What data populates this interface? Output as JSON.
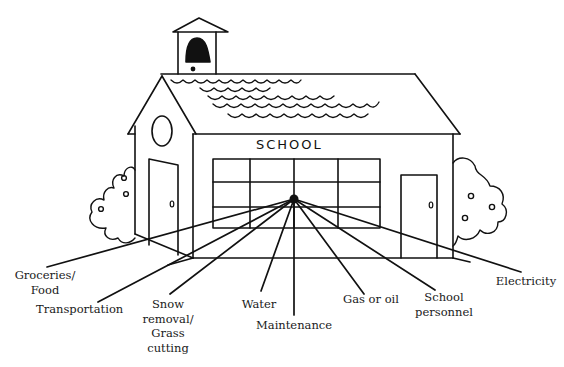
{
  "diagram": {
    "building_sign": "SCHOOL",
    "colors": {
      "stroke": "#111111",
      "background": "#ffffff",
      "text": "#1a1a1a"
    },
    "hub": {
      "x": 294,
      "y": 199
    },
    "costs": [
      {
        "id": "groceries",
        "label": "Groceries/\nFood"
      },
      {
        "id": "transportation",
        "label": "Transportation"
      },
      {
        "id": "snow",
        "label": "Snow\nremoval/\nGrass\ncutting"
      },
      {
        "id": "water",
        "label": "Water"
      },
      {
        "id": "maintenance",
        "label": "Maintenance"
      },
      {
        "id": "gas",
        "label": "Gas or oil"
      },
      {
        "id": "personnel",
        "label": "School\npersonnel"
      },
      {
        "id": "electricity",
        "label": "Electricity"
      }
    ]
  }
}
